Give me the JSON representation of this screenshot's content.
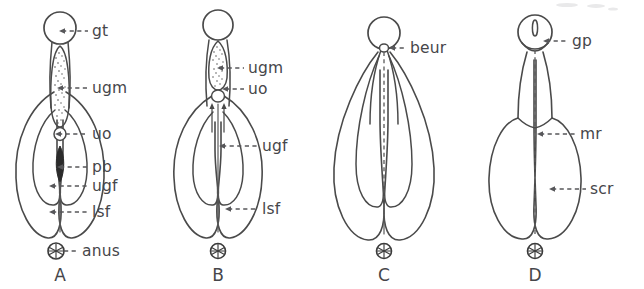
{
  "figure": {
    "panel_count": 4,
    "line_color": "#4a4a4a",
    "label_color": "#46464a",
    "background_color": "#ffffff",
    "stipple_color": "#4f4f4f",
    "solid_fill_color": "#2b2b2b"
  },
  "panels": [
    {
      "id": "A",
      "letter": "A",
      "letter_x": 60,
      "letter_y": 276,
      "stage": "indifferent",
      "has_anus": true,
      "anus_labeled": true,
      "labels": [
        {
          "key": "gt",
          "text": "gt",
          "text_x": 92,
          "text_y": 31,
          "line_x1": 62,
          "line_x2": 88,
          "line_y": 31,
          "arrow": "left",
          "arrow_x": 59
        },
        {
          "key": "ugm",
          "text": "ugm",
          "text_x": 92,
          "text_y": 88,
          "line_x1": 60,
          "line_x2": 88,
          "line_y": 88,
          "arrow": "left",
          "arrow_x": 57
        },
        {
          "key": "uo",
          "text": "uo",
          "text_x": 92,
          "text_y": 134,
          "line_x1": 58,
          "line_x2": 88,
          "line_y": 134,
          "arrow": "left",
          "arrow_x": 55
        },
        {
          "key": "pb",
          "text": "pb",
          "text_x": 92,
          "text_y": 167,
          "line_x1": 60,
          "line_x2": 88,
          "line_y": 167,
          "arrow": "left",
          "arrow_x": 57
        },
        {
          "key": "ugf",
          "text": "ugf",
          "text_x": 92,
          "text_y": 186,
          "line_x1": 52,
          "line_x2": 88,
          "line_y": 186,
          "arrow": "left",
          "arrow_x": 49
        },
        {
          "key": "lsf",
          "text": "lsf",
          "text_x": 92,
          "text_y": 212,
          "line_x1": 52,
          "line_x2": 88,
          "line_y": 212,
          "arrow": "left",
          "arrow_x": 49
        },
        {
          "key": "anus",
          "text": "anus",
          "text_x": 82,
          "text_y": 251,
          "line_x1": 62,
          "line_x2": 78,
          "line_y": 251,
          "arrow": "none",
          "arrow_x": 62
        }
      ]
    },
    {
      "id": "B",
      "letter": "B",
      "letter_x": 218,
      "letter_y": 276,
      "stage": "early fusion",
      "has_anus": true,
      "anus_labeled": false,
      "labels": [
        {
          "key": "ugm",
          "text": "ugm",
          "text_x": 248,
          "text_y": 68,
          "line_x1": 220,
          "line_x2": 244,
          "line_y": 68,
          "arrow": "left",
          "arrow_x": 217
        },
        {
          "key": "uo",
          "text": "uo",
          "text_x": 248,
          "text_y": 89,
          "line_x1": 218,
          "line_x2": 244,
          "line_y": 89,
          "arrow": "left",
          "arrow_x": 215
        },
        {
          "key": "ugf",
          "text": "ugf",
          "text_x": 262,
          "text_y": 146,
          "line_x1": 222,
          "line_x2": 258,
          "line_y": 146,
          "arrow": "left",
          "arrow_x": 219
        },
        {
          "key": "lsf",
          "text": "lsf",
          "text_x": 262,
          "text_y": 209,
          "line_x1": 228,
          "line_x2": 258,
          "line_y": 209,
          "arrow": "left",
          "arrow_x": 225
        }
      ]
    },
    {
      "id": "C",
      "letter": "C",
      "letter_x": 383,
      "letter_y": 276,
      "stage": "fused urethra",
      "has_anus": true,
      "anus_labeled": false,
      "labels": [
        {
          "key": "beur",
          "text": "beur",
          "text_x": 410,
          "text_y": 48,
          "line_x1": 392,
          "line_x2": 406,
          "line_y": 48,
          "arrow": "left",
          "arrow_x": 389
        }
      ]
    },
    {
      "id": "D",
      "letter": "D",
      "letter_x": 537,
      "letter_y": 276,
      "stage": "definitive male",
      "has_anus": true,
      "anus_labeled": false,
      "labels": [
        {
          "key": "gp",
          "text": "gp",
          "text_x": 572,
          "text_y": 41,
          "line_x1": 546,
          "line_x2": 568,
          "line_y": 41,
          "arrow": "left",
          "arrow_x": 543
        },
        {
          "key": "mr",
          "text": "mr",
          "text_x": 580,
          "text_y": 134,
          "line_x1": 540,
          "line_x2": 576,
          "line_y": 134,
          "arrow": "left",
          "arrow_x": 537
        },
        {
          "key": "scr",
          "text": "scr",
          "text_x": 590,
          "text_y": 189,
          "line_x1": 552,
          "line_x2": 586,
          "line_y": 189,
          "arrow": "left",
          "arrow_x": 549
        }
      ]
    }
  ],
  "abbreviations": {
    "gt": "genital tubercle",
    "ugm": "urogenital membrane",
    "uo": "urogenital orifice",
    "pb": "phallic body",
    "ugf": "urogenital fold",
    "lsf": "labioscrotal fold",
    "anus": "anus",
    "beur": "base of urethra",
    "gp": "genital pore",
    "mr": "median raphe",
    "scr": "scrotum"
  }
}
